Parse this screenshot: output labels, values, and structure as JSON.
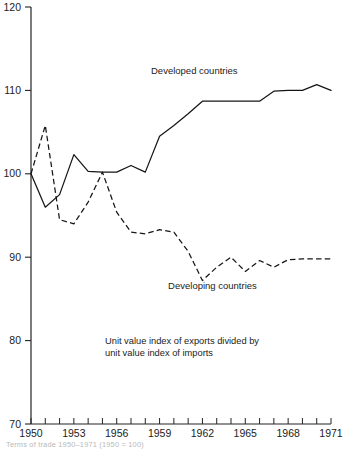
{
  "chart_data": {
    "type": "line",
    "title": "",
    "xlabel": "",
    "ylabel": "",
    "note": [
      "Unit value index of exports divided by",
      "unit value index of imports"
    ],
    "grid": false,
    "legend_position": "inline-annotation",
    "xlim": [
      1950,
      1971
    ],
    "ylim": [
      70,
      120
    ],
    "y_ticks": [
      70,
      80,
      90,
      100,
      110,
      120
    ],
    "y_tick_labels": [
      "70",
      "80",
      "90",
      "100",
      "110",
      "120"
    ],
    "x_ticks": [
      1950,
      1951,
      1952,
      1953,
      1954,
      1955,
      1956,
      1957,
      1958,
      1959,
      1960,
      1961,
      1962,
      1963,
      1964,
      1965,
      1966,
      1967,
      1968,
      1969,
      1970,
      1971
    ],
    "x_tick_labels_shown": [
      "1950",
      "1953",
      "1956",
      "1959",
      "1962",
      "1965",
      "1968",
      "1971"
    ],
    "x": [
      1950,
      1951,
      1952,
      1953,
      1954,
      1955,
      1956,
      1957,
      1958,
      1959,
      1960,
      1961,
      1962,
      1963,
      1964,
      1965,
      1966,
      1967,
      1968,
      1969,
      1970,
      1971
    ],
    "series": [
      {
        "name": "Developed countries",
        "style": "solid",
        "label_x": 1958.4,
        "label_y": 112.0,
        "values": [
          100.0,
          96.0,
          97.5,
          102.3,
          100.3,
          100.2,
          100.2,
          101.0,
          100.2,
          104.5,
          105.8,
          107.2,
          108.7,
          108.7,
          108.7,
          108.7,
          108.7,
          109.9,
          110.0,
          110.0,
          110.7,
          110.0
        ]
      },
      {
        "name": "Developing countries",
        "style": "dashed",
        "label_x": 1959.6,
        "label_y": 86.2,
        "values": [
          100.0,
          105.8,
          94.5,
          94.0,
          96.6,
          100.2,
          95.4,
          93.0,
          92.8,
          93.3,
          93.0,
          90.7,
          87.2,
          88.8,
          90.0,
          88.3,
          89.6,
          88.8,
          89.7,
          89.8,
          89.8,
          89.8
        ]
      }
    ]
  },
  "figure": {
    "caption": "Terms of trade 1950–1971 (1950 = 100)"
  }
}
